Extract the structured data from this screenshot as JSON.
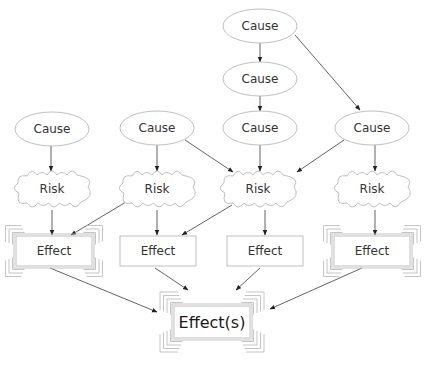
{
  "diagram": {
    "colors": {
      "stroke": "#b8b8b8",
      "edge": "#3a3a3a",
      "text": "#333333"
    },
    "nodes": [
      {
        "id": "c1",
        "type": "cause",
        "label": "Cause",
        "x": 52,
        "y": 129,
        "rx": 37,
        "ry": 17
      },
      {
        "id": "c2",
        "type": "cause",
        "label": "Cause",
        "x": 157,
        "y": 128,
        "rx": 37,
        "ry": 17
      },
      {
        "id": "c3",
        "type": "cause",
        "label": "Cause",
        "x": 260,
        "y": 128,
        "rx": 37,
        "ry": 17
      },
      {
        "id": "c4",
        "type": "cause",
        "label": "Cause",
        "x": 372,
        "y": 128,
        "rx": 37,
        "ry": 17
      },
      {
        "id": "c5",
        "type": "cause",
        "label": "Cause",
        "x": 260,
        "y": 79,
        "rx": 37,
        "ry": 17
      },
      {
        "id": "c6",
        "type": "cause",
        "label": "Cause",
        "x": 260,
        "y": 26,
        "rx": 37,
        "ry": 17
      },
      {
        "id": "r1",
        "type": "risk",
        "label": "Risk",
        "x": 52,
        "y": 189,
        "w": 78,
        "h": 34
      },
      {
        "id": "r2",
        "type": "risk",
        "label": "Risk",
        "x": 157,
        "y": 189,
        "w": 78,
        "h": 34
      },
      {
        "id": "r3",
        "type": "risk",
        "label": "Risk",
        "x": 258,
        "y": 189,
        "w": 78,
        "h": 34
      },
      {
        "id": "r4",
        "type": "risk",
        "label": "Risk",
        "x": 372,
        "y": 189,
        "w": 78,
        "h": 34
      },
      {
        "id": "e1",
        "type": "effect",
        "label": "Effect",
        "x": 54,
        "y": 251,
        "w": 76,
        "h": 30,
        "framed": true
      },
      {
        "id": "e2",
        "type": "effect",
        "label": "Effect",
        "x": 158,
        "y": 251,
        "w": 76,
        "h": 30,
        "framed": false
      },
      {
        "id": "e3",
        "type": "effect",
        "label": "Effect",
        "x": 265,
        "y": 251,
        "w": 76,
        "h": 30,
        "framed": false
      },
      {
        "id": "e4",
        "type": "effect",
        "label": "Effect",
        "x": 372,
        "y": 251,
        "w": 76,
        "h": 30,
        "framed": true
      },
      {
        "id": "ef",
        "type": "final-effect",
        "label": "Effect(s)",
        "x": 212,
        "y": 322,
        "w": 76,
        "h": 32,
        "framed": true
      }
    ],
    "edges": [
      {
        "from": "c6",
        "to": "c5",
        "x1": 260,
        "y1": 43,
        "x2": 260,
        "y2": 62
      },
      {
        "from": "c5",
        "to": "c3",
        "x1": 260,
        "y1": 96,
        "x2": 260,
        "y2": 111
      },
      {
        "from": "c6",
        "to": "c4",
        "x1": 295,
        "y1": 35,
        "x2": 360,
        "y2": 110
      },
      {
        "from": "c1",
        "to": "r1",
        "x1": 51,
        "y1": 146,
        "x2": 51,
        "y2": 171
      },
      {
        "from": "c2",
        "to": "r2",
        "x1": 157,
        "y1": 145,
        "x2": 157,
        "y2": 171
      },
      {
        "from": "c2",
        "to": "r3",
        "x1": 185,
        "y1": 140,
        "x2": 233,
        "y2": 172
      },
      {
        "from": "c3",
        "to": "r3",
        "x1": 260,
        "y1": 145,
        "x2": 260,
        "y2": 171
      },
      {
        "from": "c4",
        "to": "r3",
        "x1": 344,
        "y1": 140,
        "x2": 297,
        "y2": 172
      },
      {
        "from": "c4",
        "to": "r4",
        "x1": 375,
        "y1": 145,
        "x2": 375,
        "y2": 171
      },
      {
        "from": "r1",
        "to": "e1",
        "x1": 52,
        "y1": 210,
        "x2": 52,
        "y2": 235
      },
      {
        "from": "r2",
        "to": "e1",
        "x1": 126,
        "y1": 202,
        "x2": 71,
        "y2": 235
      },
      {
        "from": "r2",
        "to": "e2",
        "x1": 157,
        "y1": 210,
        "x2": 157,
        "y2": 235
      },
      {
        "from": "r3",
        "to": "e2",
        "x1": 232,
        "y1": 205,
        "x2": 182,
        "y2": 235
      },
      {
        "from": "r3",
        "to": "e3",
        "x1": 265,
        "y1": 210,
        "x2": 265,
        "y2": 235
      },
      {
        "from": "r4",
        "to": "e4",
        "x1": 375,
        "y1": 210,
        "x2": 375,
        "y2": 235
      },
      {
        "from": "e1",
        "to": "ef",
        "x1": 50,
        "y1": 268,
        "x2": 157,
        "y2": 312
      },
      {
        "from": "e2",
        "to": "ef",
        "x1": 155,
        "y1": 268,
        "x2": 188,
        "y2": 290
      },
      {
        "from": "e3",
        "to": "ef",
        "x1": 260,
        "y1": 268,
        "x2": 236,
        "y2": 290
      },
      {
        "from": "e4",
        "to": "ef",
        "x1": 362,
        "y1": 268,
        "x2": 270,
        "y2": 309
      }
    ]
  }
}
